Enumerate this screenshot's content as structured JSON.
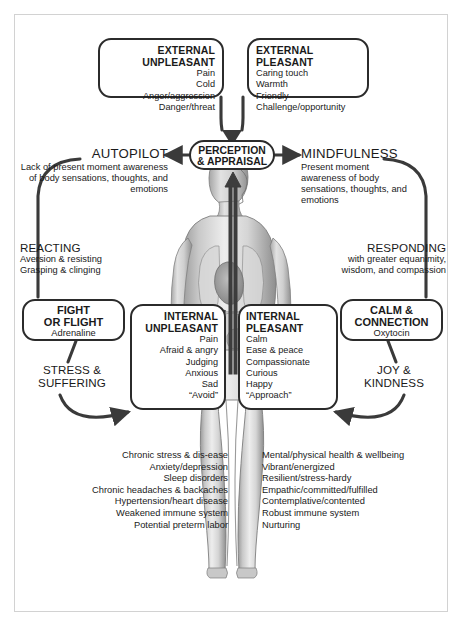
{
  "diagram": {
    "external_unpleasant": {
      "heading_line1": "EXTERNAL",
      "heading_line2": "UNPLEASANT",
      "items": [
        "Pain",
        "Cold",
        "Anger/aggression",
        "Danger/threat"
      ]
    },
    "external_pleasant": {
      "heading_line1": "EXTERNAL",
      "heading_line2": "PLEASANT",
      "items": [
        "Caring touch",
        "Warmth",
        "Friendly",
        "Challenge/opportunity"
      ]
    },
    "perception": {
      "line1": "PERCEPTION",
      "line2": "& APPRAISAL"
    },
    "autopilot": {
      "heading": "AUTOPILOT",
      "description": "Lack of present moment awareness of body sensations, thoughts, and emotions"
    },
    "mindfulness": {
      "heading": "MINDFULNESS",
      "description": "Present moment awareness of body sensations, thoughts, and emotions"
    },
    "reacting": {
      "heading": "REACTING",
      "line1": "Aversion & resisting",
      "line2": "Grasping & clinging"
    },
    "responding": {
      "heading": "RESPONDING",
      "line1": "with greater equanimity,",
      "line2": "wisdom, and compassion"
    },
    "fight_or_flight": {
      "heading_line1": "FIGHT",
      "heading_line2": "OR FLIGHT",
      "hormone": "Adrenaline"
    },
    "calm_connection": {
      "heading_line1": "CALM &",
      "heading_line2": "CONNECTION",
      "hormone": "Oxytocin"
    },
    "internal_unpleasant": {
      "heading_line1": "INTERNAL",
      "heading_line2": "UNPLEASANT",
      "items": [
        "Pain",
        "Afraid & angry",
        "Judging",
        "Anxious",
        "Sad",
        "“Avoid”"
      ]
    },
    "internal_pleasant": {
      "heading_line1": "INTERNAL",
      "heading_line2": "PLEASANT",
      "items": [
        "Calm",
        "Ease & peace",
        "Compassionate",
        "Curious",
        "Happy",
        "“Approach”"
      ]
    },
    "stress_suffering": {
      "line1": "STRESS &",
      "line2": "SUFFERING"
    },
    "joy_kindness": {
      "line1": "JOY &",
      "line2": "KINDNESS"
    },
    "outcomes_negative": [
      "Chronic stress & dis-ease",
      "Anxiety/depression",
      "Sleep disorders",
      "Chronic headaches & backaches",
      "Hypertension/heart disease",
      "Weakened immune system",
      "Potential preterm labor"
    ],
    "outcomes_positive": [
      "Mental/physical health & wellbeing",
      "Vibrant/energized",
      "Resilient/stress-hardy",
      "Empathic/committed/fulfilled",
      "Contemplative/contented",
      "Robust immune system",
      "Nurturing"
    ],
    "figure_label": "anatomical-body-illustration",
    "colors": {
      "stroke": "#2b2b2b",
      "text": "#1a1a1a",
      "frame": "#d2d2d2",
      "background": "#ffffff"
    }
  }
}
